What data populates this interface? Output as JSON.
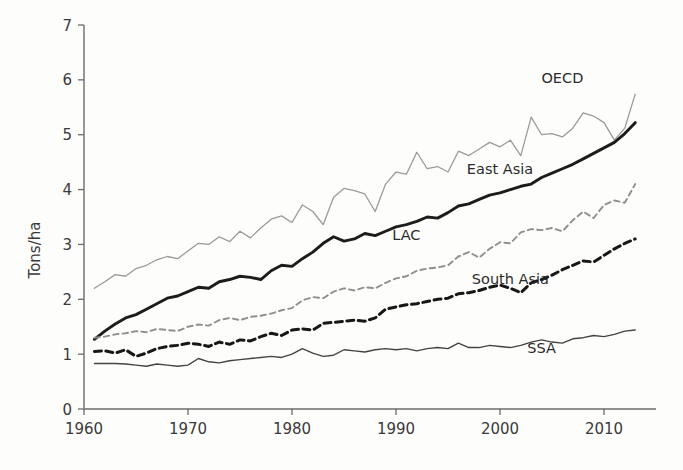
{
  "chart_data": {
    "type": "line",
    "title": "",
    "subtitle": "",
    "xlabel": "",
    "ylabel": "Tons/ha",
    "xlim": [
      1960,
      2015
    ],
    "ylim": [
      0,
      7
    ],
    "xticks": [
      1960,
      1970,
      1980,
      1990,
      2000,
      2010
    ],
    "yticks": [
      0,
      1,
      2,
      3,
      4,
      5,
      6,
      7
    ],
    "xtick_labels": [
      "1960",
      "1970",
      "1980",
      "1990",
      "2000",
      "2010"
    ],
    "ytick_labels": [
      "0",
      "1",
      "2",
      "3",
      "4",
      "5",
      "6",
      "7"
    ],
    "grid": false,
    "legend_position": "inline-annotations",
    "x": [
      1961,
      1962,
      1963,
      1964,
      1965,
      1966,
      1967,
      1968,
      1969,
      1970,
      1971,
      1972,
      1973,
      1974,
      1975,
      1976,
      1977,
      1978,
      1979,
      1980,
      1981,
      1982,
      1983,
      1984,
      1985,
      1986,
      1987,
      1988,
      1989,
      1990,
      1991,
      1992,
      1993,
      1994,
      1995,
      1996,
      1997,
      1998,
      1999,
      2000,
      2001,
      2002,
      2003,
      2004,
      2005,
      2006,
      2007,
      2008,
      2009,
      2010,
      2011,
      2012,
      2013
    ],
    "series": [
      {
        "name": "OECD",
        "style": "solid",
        "color": "#9a9a9a",
        "width": 1.3,
        "label_x": 2006,
        "label_y": 5.95,
        "values": [
          2.2,
          2.32,
          2.45,
          2.42,
          2.56,
          2.62,
          2.72,
          2.78,
          2.74,
          2.88,
          3.02,
          3.0,
          3.14,
          3.05,
          3.24,
          3.12,
          3.3,
          3.46,
          3.52,
          3.4,
          3.72,
          3.6,
          3.36,
          3.86,
          4.02,
          3.98,
          3.92,
          3.6,
          4.1,
          4.32,
          4.28,
          4.68,
          4.38,
          4.42,
          4.32,
          4.7,
          4.62,
          4.74,
          4.86,
          4.78,
          4.9,
          4.62,
          5.32,
          5.0,
          5.02,
          4.96,
          5.12,
          5.4,
          5.34,
          5.22,
          4.9,
          5.12,
          5.74
        ]
      },
      {
        "name": "East Asia",
        "style": "solid",
        "color": "#1c1c1c",
        "width": 2.9,
        "label_x": 2000,
        "label_y": 4.28,
        "values": [
          1.27,
          1.42,
          1.55,
          1.66,
          1.72,
          1.82,
          1.92,
          2.02,
          2.06,
          2.14,
          2.22,
          2.2,
          2.32,
          2.36,
          2.42,
          2.4,
          2.36,
          2.52,
          2.62,
          2.6,
          2.74,
          2.86,
          3.02,
          3.14,
          3.06,
          3.1,
          3.2,
          3.16,
          3.24,
          3.32,
          3.36,
          3.42,
          3.5,
          3.48,
          3.58,
          3.7,
          3.74,
          3.82,
          3.9,
          3.94,
          4.0,
          4.06,
          4.1,
          4.22,
          4.3,
          4.38,
          4.46,
          4.56,
          4.66,
          4.76,
          4.86,
          5.02,
          5.22
        ]
      },
      {
        "name": "LAC",
        "style": "dashed",
        "color": "#8f8f8f",
        "width": 1.9,
        "label_x": 1991,
        "label_y": 3.08,
        "values": [
          1.3,
          1.32,
          1.36,
          1.38,
          1.42,
          1.4,
          1.46,
          1.44,
          1.42,
          1.5,
          1.54,
          1.52,
          1.62,
          1.66,
          1.62,
          1.68,
          1.7,
          1.74,
          1.8,
          1.84,
          1.98,
          2.04,
          2.02,
          2.14,
          2.2,
          2.16,
          2.22,
          2.2,
          2.3,
          2.38,
          2.42,
          2.52,
          2.56,
          2.58,
          2.62,
          2.78,
          2.86,
          2.76,
          2.92,
          3.04,
          3.02,
          3.22,
          3.28,
          3.26,
          3.3,
          3.24,
          3.44,
          3.6,
          3.48,
          3.72,
          3.8,
          3.76,
          4.1
        ]
      },
      {
        "name": "South Asia",
        "style": "dashed",
        "color": "#171717",
        "width": 3.0,
        "label_x": 2001,
        "label_y": 2.28,
        "values": [
          1.05,
          1.06,
          1.02,
          1.08,
          0.96,
          1.02,
          1.1,
          1.14,
          1.16,
          1.2,
          1.18,
          1.14,
          1.22,
          1.18,
          1.26,
          1.24,
          1.32,
          1.38,
          1.34,
          1.44,
          1.46,
          1.44,
          1.56,
          1.58,
          1.6,
          1.62,
          1.6,
          1.66,
          1.82,
          1.86,
          1.9,
          1.92,
          1.96,
          2.0,
          2.02,
          2.1,
          2.12,
          2.16,
          2.22,
          2.26,
          2.2,
          2.12,
          2.3,
          2.36,
          2.44,
          2.54,
          2.62,
          2.7,
          2.68,
          2.8,
          2.92,
          3.02,
          3.1
        ]
      },
      {
        "name": "SSA",
        "style": "solid",
        "color": "#444444",
        "width": 1.4,
        "label_x": 2004,
        "label_y": 1.02,
        "values": [
          0.83,
          0.83,
          0.83,
          0.82,
          0.8,
          0.78,
          0.82,
          0.8,
          0.78,
          0.8,
          0.92,
          0.86,
          0.84,
          0.88,
          0.9,
          0.92,
          0.94,
          0.96,
          0.94,
          1.0,
          1.1,
          1.02,
          0.96,
          0.98,
          1.08,
          1.06,
          1.04,
          1.08,
          1.1,
          1.08,
          1.1,
          1.06,
          1.1,
          1.12,
          1.1,
          1.2,
          1.12,
          1.12,
          1.16,
          1.14,
          1.12,
          1.16,
          1.22,
          1.26,
          1.22,
          1.2,
          1.28,
          1.3,
          1.34,
          1.32,
          1.36,
          1.42,
          1.44
        ]
      }
    ]
  },
  "axis": {
    "y_title": "Tons/ha"
  }
}
